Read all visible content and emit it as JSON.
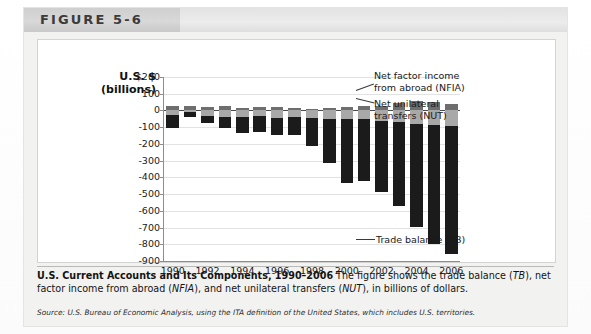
{
  "figure": {
    "label": "FIGURE 5-6",
    "axis_title_line1": "U.S. $",
    "axis_title_line2": "(billions)"
  },
  "caption": {
    "title": "U.S. Current Accounts and Its Components, 1990–2006",
    "body_1": " The figure shows the trade balance (",
    "em_tb": "TB",
    "body_2": "), net factor income from abroad (",
    "em_nfia": "NFIA",
    "body_3": "), and net unilateral transfers (",
    "em_nut": "NUT",
    "body_4": "), in billions of dollars.",
    "source": "Source: U.S. Bureau of Economic Analysis, using the ITA definition of the United States, which includes U.S. territories."
  },
  "annotations": {
    "nfia_line1": "Net factor income",
    "nfia_line2": "from abroad (NFIA)",
    "nut_line1": "Net unilateral",
    "nut_line2": "transfers (NUT)",
    "tb": "Trade balance (TB)"
  },
  "colors": {
    "trade_balance": "#1b1b1b",
    "net_unilateral_transfers": "#a8a8a8",
    "net_factor_income": "#6e6e6e",
    "header_band": "#cfcfcf",
    "card_background": "#f2f2f0"
  },
  "chart_data": {
    "type": "bar",
    "title": "U.S. Current Accounts and Its Components, 1990–2006",
    "subtitle": "",
    "xlabel": "",
    "ylabel": "U.S. $ (billions)",
    "ylim": [
      -900,
      200
    ],
    "ytick_labels": [
      "$200",
      "100",
      "0",
      "-100",
      "-200",
      "-300",
      "-400",
      "-500",
      "-600",
      "-700",
      "-800",
      "-900"
    ],
    "ytick_values": [
      200,
      100,
      0,
      -100,
      -200,
      -300,
      -400,
      -500,
      -600,
      -700,
      -800,
      -900
    ],
    "xtick_labels": [
      "1990",
      "1992",
      "1994",
      "1996",
      "1998",
      "2000",
      "2002",
      "2004",
      "2006"
    ],
    "grid": true,
    "stacked": true,
    "legend_position": "annotations-right",
    "categories": [
      1990,
      1991,
      1992,
      1993,
      1994,
      1995,
      1996,
      1997,
      1998,
      1999,
      2000,
      2001,
      2002,
      2003,
      2004,
      2005,
      2006
    ],
    "series": [
      {
        "name": "Net factor income from abroad (NFIA)",
        "color": "#6e6e6e",
        "values": [
          28,
          24,
          23,
          24,
          17,
          21,
          23,
          14,
          9,
          14,
          21,
          28,
          27,
          46,
          56,
          51,
          37
        ]
      },
      {
        "name": "Net unilateral transfers (NUT)",
        "color": "#a8a8a8",
        "values": [
          -27,
          -10,
          -35,
          -37,
          -39,
          -35,
          -43,
          -41,
          -45,
          -49,
          -54,
          -52,
          -65,
          -72,
          -81,
          -86,
          -90
        ]
      },
      {
        "name": "Trade balance (TB)",
        "color": "#1b1b1b",
        "values": [
          -77,
          -28,
          -40,
          -70,
          -98,
          -96,
          -104,
          -108,
          -166,
          -263,
          -380,
          -369,
          -425,
          -500,
          -613,
          -715,
          -766
        ]
      }
    ]
  }
}
